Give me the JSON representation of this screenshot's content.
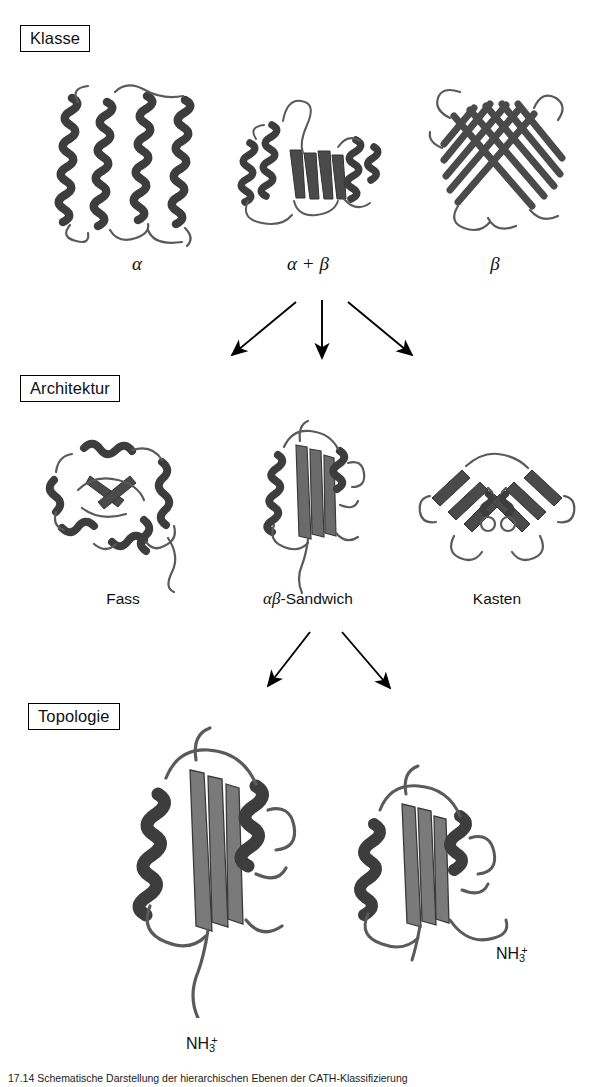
{
  "figure": {
    "levels": [
      {
        "id": "klasse",
        "label": "Klasse"
      },
      {
        "id": "architektur",
        "label": "Architektur"
      },
      {
        "id": "topologie",
        "label": "Topologie"
      }
    ],
    "class_row": {
      "structures": [
        {
          "name": "alpha-helical-bundle",
          "label": "α",
          "style": "greek"
        },
        {
          "name": "alpha-beta-protein",
          "label": "α + β",
          "style": "greek"
        },
        {
          "name": "beta-barrel-protein",
          "label": "β",
          "style": "greek"
        }
      ]
    },
    "architecture_row": {
      "structures": [
        {
          "name": "barrel-architecture",
          "label": "Fass",
          "style": "sans"
        },
        {
          "name": "alpha-beta-sandwich-architecture",
          "label_greek": "αβ",
          "label_rest": "-Sandwich",
          "style": "mixed"
        },
        {
          "name": "box-architecture",
          "label": "Kasten",
          "style": "sans"
        }
      ]
    },
    "topology_row": {
      "structures": [
        {
          "name": "topology-variant-left",
          "terminus": "NH",
          "sub": "3",
          "sup": "+"
        },
        {
          "name": "topology-variant-right",
          "terminus": "NH",
          "sub": "3",
          "sup": "+"
        }
      ]
    },
    "arrows": {
      "class_to_architecture_count": 3,
      "architecture_to_topology_count": 2
    },
    "caption": "17.14 Schematische Darstellung der hierarchischen Ebenen der CATH-Klassifizierung",
    "colors": {
      "ink": "#000000",
      "ribbon_dark": "#3f3f3f",
      "ribbon_mid": "#6e6e6e",
      "ribbon_light": "#a8a8a8",
      "background": "#ffffff"
    }
  }
}
